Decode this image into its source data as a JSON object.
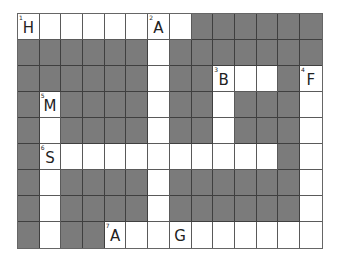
{
  "puzzle": {
    "type": "crossword",
    "rows": 9,
    "cols": 14,
    "colors": {
      "block": "#7b7b7b",
      "open": "#ffffff",
      "grid_line": "#5a5a5a",
      "text": "#222222"
    },
    "layout": [
      "........######",
      "######.#######",
      "######.##...#.",
      "#.####.##.###.",
      "#.####.##.###.",
      "#...........#.",
      "#.####.######.",
      "#.####.######.",
      "#.##.........."
    ],
    "numbers": [
      {
        "row": 0,
        "col": 0,
        "n": "1"
      },
      {
        "row": 0,
        "col": 6,
        "n": "2"
      },
      {
        "row": 2,
        "col": 9,
        "n": "3"
      },
      {
        "row": 2,
        "col": 13,
        "n": "4"
      },
      {
        "row": 3,
        "col": 1,
        "n": "5"
      },
      {
        "row": 5,
        "col": 1,
        "n": "6"
      },
      {
        "row": 8,
        "col": 4,
        "n": "7"
      }
    ],
    "letters": [
      {
        "row": 0,
        "col": 0,
        "ch": "H"
      },
      {
        "row": 0,
        "col": 6,
        "ch": "A"
      },
      {
        "row": 2,
        "col": 9,
        "ch": "B"
      },
      {
        "row": 2,
        "col": 13,
        "ch": "F"
      },
      {
        "row": 3,
        "col": 1,
        "ch": "M"
      },
      {
        "row": 5,
        "col": 1,
        "ch": "S"
      },
      {
        "row": 8,
        "col": 4,
        "ch": "A"
      },
      {
        "row": 8,
        "col": 7,
        "ch": "G"
      }
    ]
  }
}
